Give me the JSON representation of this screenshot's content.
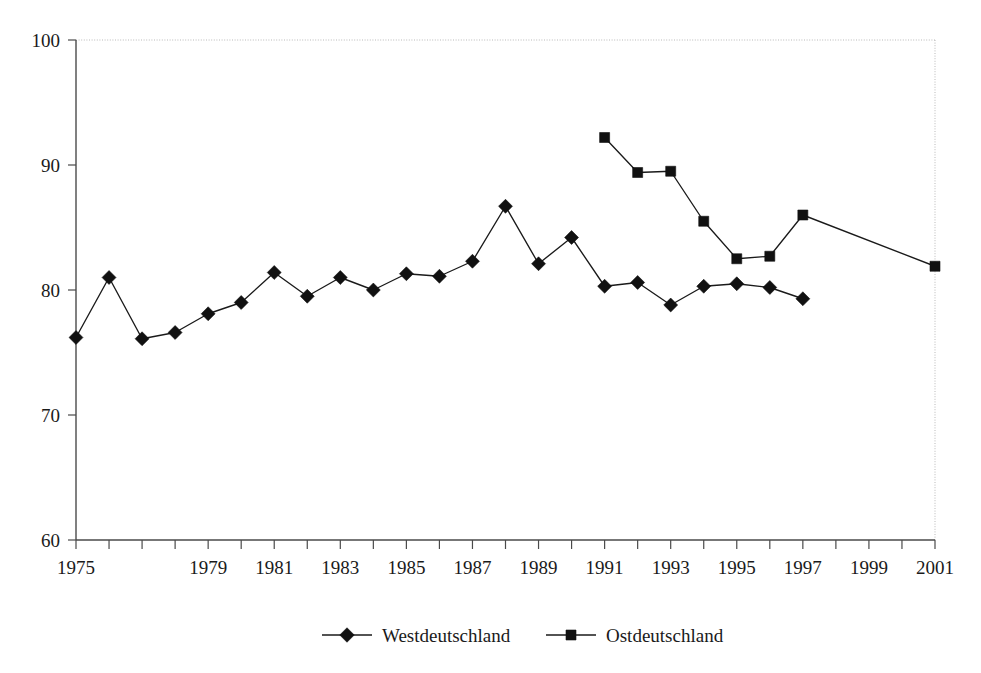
{
  "chart_data": {
    "type": "line",
    "title": "",
    "subtitle": "",
    "xlabel": "",
    "ylabel": "",
    "xlim": [
      1975,
      2001
    ],
    "ylim": [
      60,
      100
    ],
    "grid": false,
    "legend_position": "bottom",
    "y_ticks": [
      60,
      70,
      80,
      90,
      100
    ],
    "y_tick_labels": [
      "60",
      "70",
      "80",
      "90",
      "100"
    ],
    "x_ticks": [
      1975,
      1976,
      1977,
      1978,
      1979,
      1980,
      1981,
      1982,
      1983,
      1984,
      1985,
      1986,
      1987,
      1988,
      1989,
      1990,
      1991,
      1992,
      1993,
      1994,
      1995,
      1996,
      1997,
      1998,
      1999,
      2000,
      2001
    ],
    "x_tick_labels": [
      {
        "x": 1975,
        "label": "1975"
      },
      {
        "x": 1979,
        "label": "1979"
      },
      {
        "x": 1981,
        "label": "1981"
      },
      {
        "x": 1983,
        "label": "1983"
      },
      {
        "x": 1985,
        "label": "1985"
      },
      {
        "x": 1987,
        "label": "1987"
      },
      {
        "x": 1989,
        "label": "1989"
      },
      {
        "x": 1991,
        "label": "1991"
      },
      {
        "x": 1993,
        "label": "1993"
      },
      {
        "x": 1995,
        "label": "1995"
      },
      {
        "x": 1997,
        "label": "1997"
      },
      {
        "x": 1999,
        "label": "1999"
      },
      {
        "x": 2001,
        "label": "2001"
      }
    ],
    "series": [
      {
        "name": "Westdeutschland",
        "marker": "diamond",
        "color": "#111111",
        "x": [
          1975,
          1976,
          1977,
          1978,
          1979,
          1980,
          1981,
          1982,
          1983,
          1984,
          1985,
          1986,
          1987,
          1988,
          1989,
          1990,
          1991,
          1992,
          1993,
          1994,
          1995,
          1996,
          1997,
          1998,
          1999,
          2000,
          2001
        ],
        "values": [
          76.2,
          81.0,
          76.1,
          76.6,
          78.1,
          79.0,
          81.4,
          79.5,
          81.0,
          80.0,
          81.3,
          81.1,
          82.3,
          86.7,
          82.1,
          84.2,
          80.3,
          80.6,
          78.8,
          80.3,
          80.5,
          80.2,
          79.3,
          null,
          null,
          null,
          null
        ]
      },
      {
        "name": "Ostdeutschland",
        "marker": "square",
        "color": "#111111",
        "x": [
          1991,
          1992,
          1993,
          1994,
          1995,
          1996,
          1997,
          2001
        ],
        "values": [
          92.2,
          89.4,
          89.5,
          85.5,
          82.5,
          82.7,
          86.0,
          81.9
        ]
      }
    ],
    "legend": [
      {
        "label": "Westdeutschland",
        "marker": "diamond"
      },
      {
        "label": "Ostdeutschland",
        "marker": "square"
      }
    ]
  }
}
